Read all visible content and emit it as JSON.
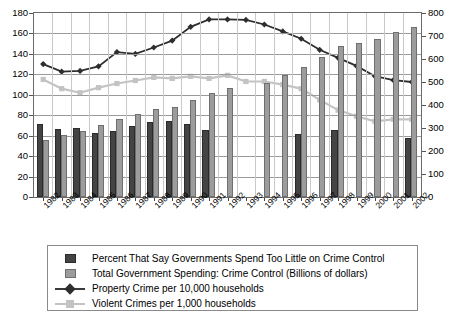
{
  "chart_data": {
    "type": "bar",
    "title": "",
    "xlabel": "",
    "ylabel": "",
    "grid": true,
    "legend_position": "bottom",
    "categories": [
      "1982",
      "1983",
      "1984",
      "1985",
      "1986",
      "1987",
      "1988",
      "1989",
      "1990",
      "1991",
      "1992",
      "1993",
      "1994",
      "1995",
      "1996",
      "1997",
      "1998",
      "1999",
      "2000",
      "2001",
      "2002"
    ],
    "axes": {
      "left": {
        "min": 0,
        "max": 180,
        "ticks": [
          0,
          20,
          40,
          60,
          80,
          100,
          120,
          140,
          160,
          180
        ]
      },
      "right": {
        "min": 0,
        "max": 800,
        "ticks": [
          0,
          100,
          200,
          300,
          400,
          500,
          600,
          700,
          800
        ]
      }
    },
    "series": [
      {
        "name": "Percent That Say Governments Spend Too Little on Crime Control",
        "type": "bar",
        "axis": "left",
        "color": "#444444",
        "values": [
          71,
          67,
          68,
          63,
          65,
          69,
          73,
          74,
          71,
          66,
          null,
          null,
          null,
          null,
          62,
          null,
          66,
          null,
          null,
          null,
          58
        ]
      },
      {
        "name": "Total Government Spending: Crime Control (Billions of dollars)",
        "type": "bar",
        "axis": "left",
        "color": "#9c9c9c",
        "values": [
          56,
          61,
          65,
          70,
          76,
          81,
          86,
          88,
          95,
          102,
          107,
          null,
          112,
          119,
          127,
          137,
          148,
          151,
          155,
          161,
          166
        ]
      },
      {
        "name": "Property Crime per 10,000 households",
        "type": "line",
        "axis": "right",
        "color": "#2e2e2e",
        "marker": "diamond",
        "values": [
          578,
          545,
          548,
          568,
          630,
          622,
          650,
          680,
          740,
          772,
          772,
          770,
          750,
          720,
          688,
          640,
          605,
          570,
          525,
          508,
          500
        ]
      },
      {
        "name": "Violent Crimes per 1,000 households",
        "type": "line",
        "axis": "left",
        "color": "#c3c3c3",
        "marker": "square",
        "values": [
          115,
          106,
          102,
          107,
          111,
          114,
          117,
          116,
          118,
          116,
          119,
          113,
          113,
          110,
          106,
          95,
          85,
          79,
          74,
          76,
          76
        ]
      }
    ]
  },
  "legend": {
    "items": [
      {
        "key": "bar-dark",
        "label": "Percent That Say Governments Spend Too Little on Crime Control"
      },
      {
        "key": "bar-light",
        "label": "Total Government Spending: Crime Control (Billions of dollars)"
      },
      {
        "key": "line-dark",
        "label": "Property Crime per 10,000 households"
      },
      {
        "key": "line-light",
        "label": "Violent Crimes per 1,000 households"
      }
    ]
  },
  "axis_labels": {
    "left": [
      "180",
      "160",
      "140",
      "120",
      "100",
      "80",
      "60",
      "40",
      "20",
      "0"
    ],
    "right": [
      "800",
      "700",
      "600",
      "500",
      "400",
      "300",
      "200",
      "100",
      "0"
    ]
  }
}
